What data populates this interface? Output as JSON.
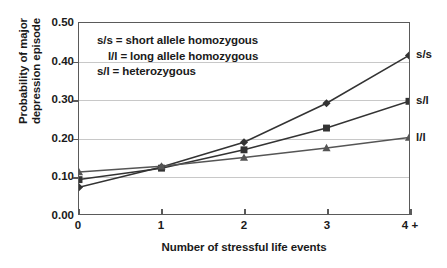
{
  "chart_data": {
    "type": "line",
    "title": "",
    "xlabel": "Number of stressful life events",
    "ylabel": "Probability of major depression episode",
    "ylabel_lines": [
      "Probability of major",
      "depression episode"
    ],
    "categories": [
      "0",
      "1",
      "2",
      "3",
      "4 +"
    ],
    "x": [
      0,
      1,
      2,
      3,
      4
    ],
    "xlim": [
      0,
      4
    ],
    "ylim": [
      0.0,
      0.5
    ],
    "yticks": [
      "0.00",
      "0.10",
      "0.20",
      "0.30",
      "0.40",
      "0.50"
    ],
    "ytick_values": [
      0.0,
      0.1,
      0.2,
      0.3,
      0.4,
      0.5
    ],
    "grid": true,
    "grid_axis": "y",
    "legend_position": "inside-top-left",
    "series": [
      {
        "name": "s/s",
        "end_label": "s/s",
        "marker": "diamond",
        "color": "#333333",
        "values": [
          0.07,
          0.123,
          0.188,
          0.29,
          0.415
        ]
      },
      {
        "name": "s/l",
        "end_label": "s/l",
        "marker": "square",
        "color": "#333333",
        "values": [
          0.09,
          0.12,
          0.168,
          0.225,
          0.295
        ]
      },
      {
        "name": "l/l",
        "end_label": "l/l",
        "marker": "triangle",
        "color": "#555555",
        "values": [
          0.11,
          0.125,
          0.148,
          0.173,
          0.2
        ]
      }
    ],
    "annotations": [
      "s/s = short allele homozygous",
      "l/l = long allele homozygous",
      "s/l = heterozygous"
    ]
  },
  "legend": {
    "line1": "s/s = short allele homozygous",
    "line2": "l/l = long allele homozygous",
    "line3": "s/l = heterozygous"
  },
  "axes": {
    "x_title": "Number of stressful life events",
    "y_title_line1": "Probability of major",
    "y_title_line2": "depression episode",
    "x_tick_0": "0",
    "x_tick_1": "1",
    "x_tick_2": "2",
    "x_tick_3": "3",
    "x_tick_4": "4 +",
    "y_tick_0": "0.00",
    "y_tick_1": "0.10",
    "y_tick_2": "0.20",
    "y_tick_3": "0.30",
    "y_tick_4": "0.40",
    "y_tick_5": "0.50"
  },
  "end_labels": {
    "ss": "s/s",
    "sl": "s/l",
    "ll": "l/l"
  },
  "colors": {
    "line": "#333333",
    "grid": "#c8c8c8",
    "axis": "#5a5a5a",
    "text": "#1a1a1a",
    "background": "#ffffff"
  }
}
